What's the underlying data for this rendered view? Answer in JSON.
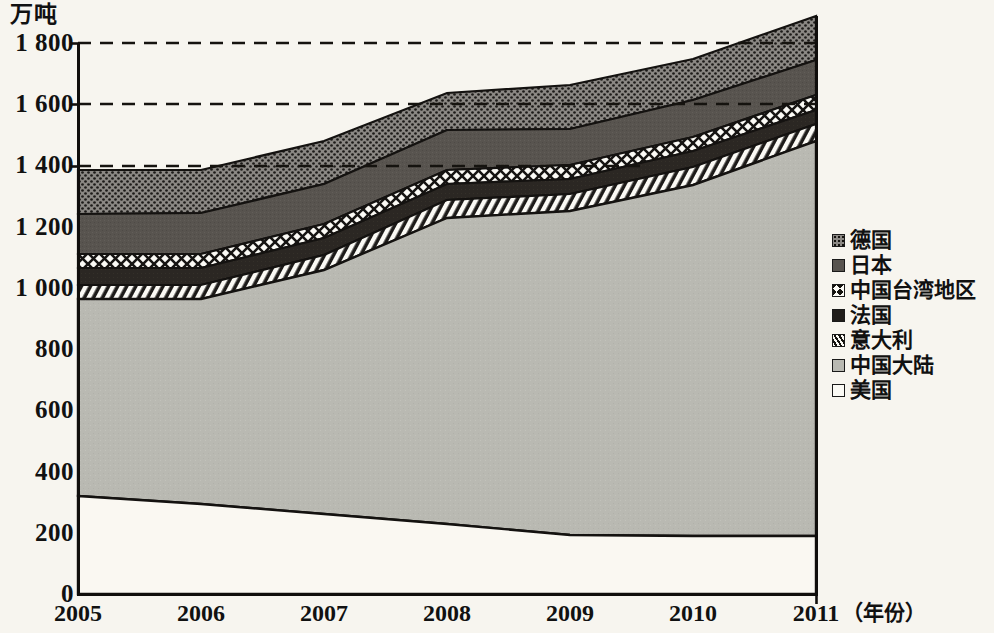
{
  "chart_data": {
    "type": "area",
    "stacked": true,
    "title": "",
    "subtitle": "",
    "ylabel": "万吨",
    "xlabel": "(年份)",
    "xlabel_plain": "年份",
    "categories": [
      "2005",
      "2006",
      "2007",
      "2008",
      "2009",
      "2010",
      "2011"
    ],
    "x": [
      2005,
      2006,
      2007,
      2008,
      2009,
      2010,
      2011
    ],
    "ylim": [
      0,
      1800
    ],
    "yticks": [
      0,
      200,
      400,
      600,
      800,
      1000,
      1200,
      1400,
      1600,
      1800
    ],
    "ytick_labels": [
      "0",
      "200",
      "400",
      "600",
      "800",
      "1 000",
      "1 200",
      "1 400",
      "1 600",
      "1 800"
    ],
    "grid": "dashed horizontal gridlines at 1400, 1600, 1800",
    "gridlines": [
      1400,
      1600,
      1800
    ],
    "legend_position": "right",
    "stack_order_bottom_to_top": [
      "美国",
      "中国大陆",
      "意大利",
      "法国",
      "中国台湾地区",
      "日本",
      "德国"
    ],
    "series": [
      {
        "name": "美国",
        "name_en": "United States",
        "pattern": "plain-white",
        "color": "#faf8f2",
        "values": [
          320,
          295,
          260,
          230,
          192,
          192,
          190
        ]
      },
      {
        "name": "中国大陆",
        "name_en": "Mainland China",
        "pattern": "solid-light-gray",
        "color": "#b8b8b2",
        "values": [
          645,
          675,
          800,
          1000,
          1058,
          1145,
          1290
        ]
      },
      {
        "name": "意大利",
        "name_en": "Italy",
        "pattern": "diagonal-hatch",
        "color": "#6e6e68",
        "values": [
          45,
          45,
          48,
          60,
          55,
          60,
          55
        ]
      },
      {
        "name": "法国",
        "name_en": "France",
        "pattern": "solid-dark",
        "color": "#2b2723",
        "values": [
          55,
          55,
          55,
          52,
          50,
          52,
          45
        ]
      },
      {
        "name": "中国台湾地区",
        "name_en": "Taiwan, China",
        "pattern": "crosshatch-diamond",
        "color": "#ffffff",
        "values": [
          45,
          45,
          45,
          45,
          45,
          45,
          50
        ]
      },
      {
        "name": "日本",
        "name_en": "Japan",
        "pattern": "solid-medium-gray",
        "color": "#585450",
        "values": [
          130,
          130,
          130,
          130,
          120,
          120,
          120
        ]
      },
      {
        "name": "德国",
        "name_en": "Germany",
        "pattern": "dotted-screen",
        "color": "#777370",
        "values": [
          145,
          140,
          140,
          120,
          145,
          135,
          140
        ]
      }
    ],
    "totals": [
      1385,
      1385,
      1478,
      1637,
      1665,
      1749,
      1890
    ]
  },
  "axis": {
    "unit_caption": "万吨",
    "y_tick_labels": [
      "1 800",
      "1 600",
      "1 400",
      "1 200",
      "1 000",
      "800",
      "600",
      "400",
      "200",
      "0"
    ],
    "x_tick_labels": [
      "2005",
      "2006",
      "2007",
      "2008",
      "2009",
      "2010",
      "2011"
    ],
    "x_unit_caption": "（年份）"
  },
  "legend": {
    "items": [
      {
        "label": "德国",
        "pattern": "dotted-screen"
      },
      {
        "label": "日本",
        "pattern": "solid-medium-gray"
      },
      {
        "label": "中国台湾地区",
        "pattern": "crosshatch-diamond"
      },
      {
        "label": "法国",
        "pattern": "solid-dark"
      },
      {
        "label": "意大利",
        "pattern": "diagonal-hatch"
      },
      {
        "label": "中国大陆",
        "pattern": "solid-light-gray"
      },
      {
        "label": "美国",
        "pattern": "plain-white"
      }
    ]
  },
  "colors": {
    "background": "#f7f5ef",
    "axis": "#111111",
    "germany": "#777370",
    "japan": "#585450",
    "taiwan": "#ffffff",
    "france": "#2b2723",
    "italy": "#6e6e68",
    "mainland_china": "#b8b8b2",
    "usa": "#faf8f2"
  }
}
